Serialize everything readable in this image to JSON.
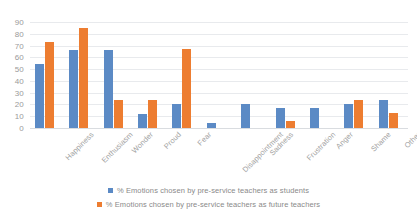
{
  "chart_data": {
    "type": "bar",
    "title": "",
    "xlabel": "",
    "ylabel": "",
    "ylim": [
      0,
      90
    ],
    "yticks": [
      0,
      10,
      20,
      30,
      40,
      50,
      60,
      70,
      80,
      90
    ],
    "grid": true,
    "legend_position": "bottom",
    "categories": [
      "Happiness",
      "Enthusiasm",
      "Wonder",
      "Proud",
      "Fear",
      "Disappointment",
      "Sadness",
      "Frustration",
      "Anger",
      "Shame",
      "Other"
    ],
    "series": [
      {
        "name": "% Emotions chosen by pre-service teachers as students",
        "color": "#5b8ac5",
        "values": [
          54,
          66,
          66,
          12,
          20,
          4,
          20,
          17,
          17,
          20,
          24
        ]
      },
      {
        "name": "% Emotions chosen by pre-service teachers as future teachers",
        "color": "#ed7d31",
        "values": [
          73,
          85,
          24,
          24,
          67,
          0,
          0,
          6,
          0,
          24,
          13
        ]
      }
    ]
  },
  "legend": {
    "items": [
      {
        "label": "% Emotions chosen by pre-service teachers as students",
        "color": "#5b8ac5"
      },
      {
        "label": "% Emotions chosen by pre-service teachers as future teachers",
        "color": "#ed7d31"
      }
    ]
  }
}
